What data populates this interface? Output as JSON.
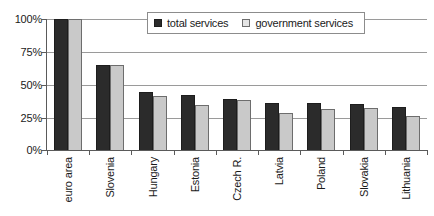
{
  "chart_data": {
    "type": "bar",
    "title": "",
    "subtitle": "",
    "xlabel": "",
    "ylabel": "",
    "ylim": [
      0,
      100
    ],
    "yticks": [
      "0%",
      "25%",
      "50%",
      "75%",
      "100%"
    ],
    "ytick_values": [
      0,
      25,
      50,
      75,
      100
    ],
    "grid": true,
    "legend_position": "top-center",
    "categories": [
      "euro area",
      "Slovenia",
      "Hungary",
      "Estonia",
      "Czech R.",
      "Latvia",
      "Poland",
      "Slovakia",
      "Lithuania"
    ],
    "category_lines": [
      [
        "euro",
        "area"
      ],
      [
        "Slovenia"
      ],
      [
        "Hungary"
      ],
      [
        "Estonia"
      ],
      [
        "Czech",
        "R."
      ],
      [
        "Latvia"
      ],
      [
        "Poland"
      ],
      [
        "Slovakia"
      ],
      [
        "Lithuania"
      ]
    ],
    "series": [
      {
        "name": "total services",
        "color": "#2b2b2b",
        "values": [
          100,
          65,
          44,
          42,
          39,
          36,
          36,
          35,
          33
        ]
      },
      {
        "name": "government services",
        "color": "#c9c9c9",
        "values": [
          100,
          65,
          41,
          34,
          38,
          28,
          31,
          32,
          26
        ]
      }
    ]
  },
  "legend": {
    "items": [
      {
        "label": "total services",
        "swatch": "dark-square-icon"
      },
      {
        "label": "government services",
        "swatch": "light-square-icon"
      }
    ]
  }
}
